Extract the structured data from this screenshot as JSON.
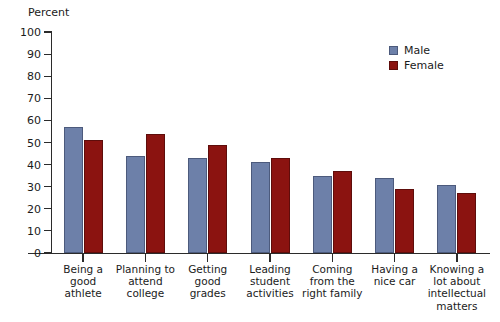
{
  "chart_data": {
    "type": "bar",
    "title": "",
    "xlabel": "",
    "ylabel": "Percent",
    "ylim": [
      0,
      100
    ],
    "ytick_step": 10,
    "yticks": [
      100,
      90,
      80,
      70,
      60,
      50,
      40,
      30,
      20,
      10,
      0
    ],
    "grid": false,
    "legend_position": "top-right",
    "categories": [
      "Being a good athlete",
      "Planning to attend college",
      "Getting good grades",
      "Leading student activities",
      "Coming from the right family",
      "Having a nice car",
      "Knowing a lot about intellectual matters"
    ],
    "category_lines": [
      [
        "Being a",
        "good",
        "athlete"
      ],
      [
        "Planning to",
        "attend",
        "college"
      ],
      [
        "Getting",
        "good",
        "grades"
      ],
      [
        "Leading",
        "student",
        "activities"
      ],
      [
        "Coming",
        "from the",
        "right family"
      ],
      [
        "Having a",
        "nice car"
      ],
      [
        "Knowing a",
        "lot about",
        "intellectual",
        "matters"
      ]
    ],
    "series": [
      {
        "name": "Male",
        "color": "#6d80a9",
        "values": [
          57,
          44,
          43,
          41,
          35,
          34,
          31
        ]
      },
      {
        "name": "Female",
        "color": "#8b1310",
        "values": [
          51,
          54,
          49,
          43,
          37,
          29,
          27
        ]
      }
    ]
  },
  "legend": {
    "items": [
      {
        "label": "Male",
        "color": "#6d80a9"
      },
      {
        "label": "Female",
        "color": "#8b1310"
      }
    ]
  },
  "axis": {
    "y_title": "Percent"
  }
}
